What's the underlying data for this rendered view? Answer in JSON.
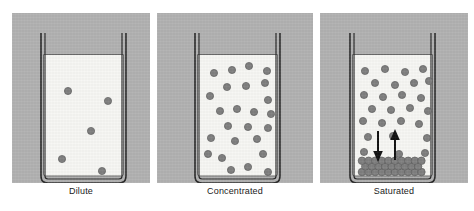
{
  "figure": {
    "panel_background_color": "#b2b2b2",
    "liquid_color": "#f7f7f4",
    "particle_color": "#808080",
    "particle_outline_color": "#5e5e5e",
    "beaker_outline_color": "#2b2b2b",
    "arrow_color": "#121212",
    "page_background_color": "#ffffff"
  },
  "panels": [
    {
      "id": "dilute",
      "label": "Dilute",
      "particle_count": 5,
      "has_crystal_bed": false,
      "has_equilibrium_arrows": false,
      "particles": [
        {
          "x": 22,
          "y": 32
        },
        {
          "x": 62,
          "y": 42
        },
        {
          "x": 45,
          "y": 72
        },
        {
          "x": 16,
          "y": 100
        },
        {
          "x": 56,
          "y": 112
        }
      ]
    },
    {
      "id": "concentrated",
      "label": "Concentrated",
      "particle_count": 24,
      "has_crystal_bed": false,
      "has_equilibrium_arrows": false,
      "particles": [
        {
          "x": 14,
          "y": 14
        },
        {
          "x": 32,
          "y": 11
        },
        {
          "x": 49,
          "y": 7
        },
        {
          "x": 67,
          "y": 12
        },
        {
          "x": 27,
          "y": 28
        },
        {
          "x": 46,
          "y": 27
        },
        {
          "x": 65,
          "y": 24
        },
        {
          "x": 10,
          "y": 37
        },
        {
          "x": 68,
          "y": 41
        },
        {
          "x": 20,
          "y": 52
        },
        {
          "x": 37,
          "y": 50
        },
        {
          "x": 54,
          "y": 53
        },
        {
          "x": 71,
          "y": 55
        },
        {
          "x": 28,
          "y": 67
        },
        {
          "x": 48,
          "y": 68
        },
        {
          "x": 68,
          "y": 69
        },
        {
          "x": 11,
          "y": 79
        },
        {
          "x": 35,
          "y": 82
        },
        {
          "x": 57,
          "y": 80
        },
        {
          "x": 8,
          "y": 95
        },
        {
          "x": 22,
          "y": 99
        },
        {
          "x": 63,
          "y": 95
        },
        {
          "x": 31,
          "y": 111
        },
        {
          "x": 48,
          "y": 108
        },
        {
          "x": 68,
          "y": 113
        }
      ]
    },
    {
      "id": "saturated",
      "label": "Saturated",
      "particle_count": 26,
      "has_crystal_bed": true,
      "has_equilibrium_arrows": true,
      "crystal_bed_rows": 3,
      "crystal_bed_columns": 10,
      "arrows": [
        {
          "direction": "down",
          "name": "crystallization-arrow"
        },
        {
          "direction": "up",
          "name": "dissolution-arrow"
        }
      ],
      "particles": [
        {
          "x": 10,
          "y": 12
        },
        {
          "x": 30,
          "y": 10
        },
        {
          "x": 50,
          "y": 13
        },
        {
          "x": 68,
          "y": 10
        },
        {
          "x": 20,
          "y": 24
        },
        {
          "x": 40,
          "y": 26
        },
        {
          "x": 59,
          "y": 24
        },
        {
          "x": 74,
          "y": 22
        },
        {
          "x": 9,
          "y": 36
        },
        {
          "x": 28,
          "y": 38
        },
        {
          "x": 47,
          "y": 36
        },
        {
          "x": 66,
          "y": 39
        },
        {
          "x": 17,
          "y": 50
        },
        {
          "x": 36,
          "y": 51
        },
        {
          "x": 55,
          "y": 49
        },
        {
          "x": 73,
          "y": 52
        },
        {
          "x": 8,
          "y": 62
        },
        {
          "x": 27,
          "y": 64
        },
        {
          "x": 46,
          "y": 62
        },
        {
          "x": 64,
          "y": 65
        },
        {
          "x": 13,
          "y": 78
        },
        {
          "x": 38,
          "y": 77
        },
        {
          "x": 72,
          "y": 79
        },
        {
          "x": 9,
          "y": 93
        },
        {
          "x": 44,
          "y": 95
        },
        {
          "x": 70,
          "y": 94
        }
      ]
    }
  ]
}
